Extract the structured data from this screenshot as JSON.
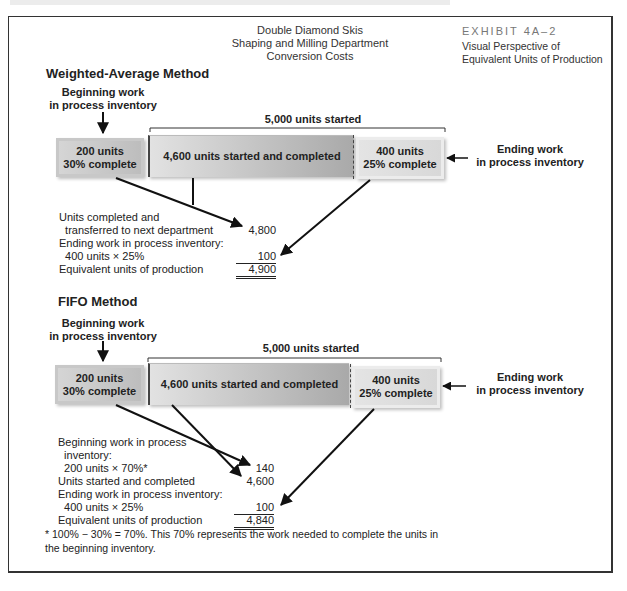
{
  "header": {
    "title_lines": [
      "Double Diamond Skis",
      "Shaping and Milling Department",
      "Conversion Costs"
    ],
    "exhibit_number": "EXHIBIT 4A–2",
    "exhibit_subtitle_lines": [
      "Visual Perspective of",
      "Equivalent Units of Production"
    ]
  },
  "weighted_average": {
    "heading": "Weighted-Average Method",
    "beginning_label_lines": [
      "Beginning work",
      "in process inventory"
    ],
    "started_label": "5,000 units started",
    "ending_label_lines": [
      "Ending work",
      "in process inventory"
    ],
    "boxes": {
      "beginning": [
        "200 units",
        "30% complete"
      ],
      "middle": "4,600 units started and completed",
      "ending": [
        "400 units",
        "25% complete"
      ]
    },
    "schedule": [
      {
        "label_lines": [
          "Units completed and",
          "  transferred to next department"
        ],
        "value": "4,800"
      },
      {
        "label_lines": [
          "Ending work in process inventory:",
          "  400 units × 25%"
        ],
        "value": "100"
      },
      {
        "label_lines": [
          "Equivalent units of production"
        ],
        "value": "4,900"
      }
    ]
  },
  "fifo": {
    "heading": "FIFO Method",
    "beginning_label_lines": [
      "Beginning work",
      "in process inventory"
    ],
    "started_label": "5,000 units started",
    "ending_label_lines": [
      "Ending work",
      "in process inventory"
    ],
    "boxes": {
      "beginning": [
        "200 units",
        "30% complete"
      ],
      "middle": "4,600 units started and completed",
      "ending": [
        "400 units",
        "25% complete"
      ]
    },
    "schedule": [
      {
        "label_lines": [
          "Beginning work in process",
          "  inventory:",
          "  200 units × 70%*"
        ],
        "value": "140"
      },
      {
        "label_lines": [
          "Units started and completed"
        ],
        "value": "4,600"
      },
      {
        "label_lines": [
          "Ending work in process inventory:",
          "  400 units × 25%"
        ],
        "value": "100"
      },
      {
        "label_lines": [
          "Equivalent units of production"
        ],
        "value": "4,840"
      }
    ]
  },
  "footnote_lines": [
    "* 100% − 30% = 70%. This 70% represents the work needed to complete the units in",
    "the beginning inventory."
  ]
}
